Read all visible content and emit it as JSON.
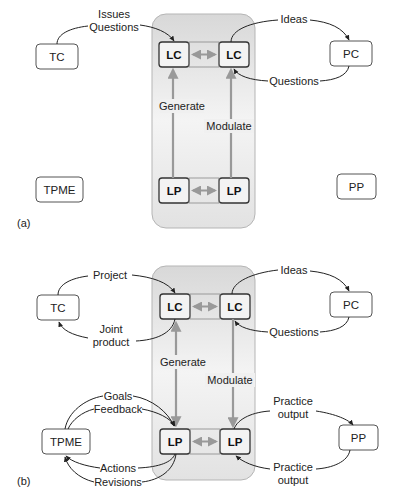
{
  "panels": [
    {
      "id": "a",
      "label": "(a)",
      "nodes": {
        "tc": "TC",
        "pc": "PC",
        "tpme": "TPME",
        "pp": "PP",
        "lc_left": "LC",
        "lc_right": "LC",
        "lp_left": "LP",
        "lp_right": "LP"
      },
      "edges": {
        "tc_to_lc": "Issues\nQuestions",
        "tc_to_lc_line1": "Issues",
        "tc_to_lc_line2": "Questions",
        "lc_to_pc": "Ideas",
        "pc_to_lc": "Questions",
        "lp_to_lc_left": "Generate",
        "lp_to_lc_right": "Modulate"
      }
    },
    {
      "id": "b",
      "label": "(b)",
      "nodes": {
        "tc": "TC",
        "pc": "PC",
        "tpme": "TPME",
        "pp": "PP",
        "lc_left": "LC",
        "lc_right": "LC",
        "lp_left": "LP",
        "lp_right": "LP"
      },
      "edges": {
        "tc_to_lc": "Project",
        "lc_to_tc_line1": "Joint",
        "lc_to_tc_line2": "product",
        "lc_to_pc": "Ideas",
        "pc_to_lc": "Questions",
        "lc_to_lp_left": "Generate",
        "lc_to_lp_right": "Modulate",
        "tpme_to_lp_goals": "Goals",
        "tpme_to_lp_feedback": "Feedback",
        "lp_to_tpme_actions": "Actions",
        "lp_to_tpme_revisions": "Revisions",
        "lp_to_pp_line1": "Practice",
        "lp_to_pp_line2": "output",
        "pp_to_lp_line1": "Practice",
        "pp_to_lp_line2": "output"
      }
    }
  ],
  "colors": {
    "node_border": "#555555",
    "core_border": "#333333",
    "core_panel_top": "#dcdcdc",
    "core_panel_bottom": "#f2f2f2",
    "gray_arrow": "#9a9a9a",
    "black_arrow": "#222222"
  }
}
